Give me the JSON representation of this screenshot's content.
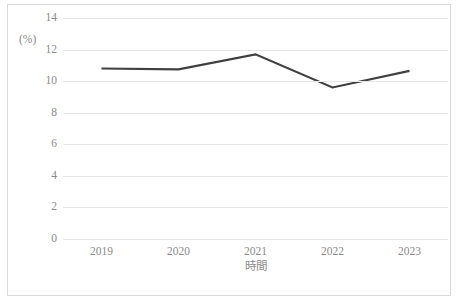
{
  "chart_data": {
    "type": "line",
    "title": "",
    "xlabel": "時間",
    "ylabel": "(%)",
    "categories": [
      "2019",
      "2020",
      "2021",
      "2022",
      "2023"
    ],
    "series": [
      {
        "name": "",
        "values": [
          10.8,
          10.75,
          11.7,
          9.6,
          10.65
        ],
        "color": "#404040"
      }
    ],
    "ylim": [
      0,
      14
    ],
    "yticks": [
      0,
      2,
      4,
      6,
      8,
      10,
      12,
      14
    ],
    "ytick_labels": [
      "0",
      "2",
      "4",
      "6",
      "8",
      "10",
      "12",
      "14"
    ],
    "grid": true,
    "grid_color": "#e6e6e6",
    "legend": "none",
    "border_color": "#d9d9d9",
    "tick_label_color": "#8a8a8a"
  }
}
